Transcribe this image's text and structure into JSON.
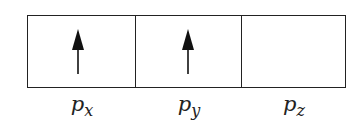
{
  "diagram": {
    "orbitals": [
      {
        "main": "p",
        "sub": "x",
        "electrons": "up"
      },
      {
        "main": "p",
        "sub": "y",
        "electrons": "up"
      },
      {
        "main": "p",
        "sub": "z",
        "electrons": "empty"
      }
    ]
  }
}
